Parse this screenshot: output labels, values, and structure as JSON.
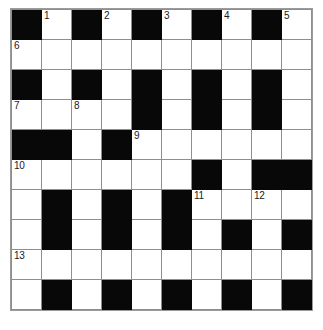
{
  "puzzle": {
    "title": "Crossword Grid",
    "size": {
      "rows": 10,
      "cols": 10
    },
    "colors": {
      "block": "#080808",
      "empty": "#ffffff",
      "gridline": "#8e8e8e",
      "number": "#1a1a1a"
    },
    "legend": {
      "block_char": "#",
      "empty_char": "."
    },
    "grid": [
      "#.#.#.#.#.",
      "..........",
      "#.#.#.#.#.",
      "....#.#.#.",
      "##.#......",
      "......#.##",
      ".#.#.#....",
      ".#.#.#.#.#",
      "..........",
      ".#.#.#.#.#"
    ],
    "numbers": [
      {
        "label": "1",
        "row": 0,
        "col": 1
      },
      {
        "label": "2",
        "row": 0,
        "col": 3
      },
      {
        "label": "3",
        "row": 0,
        "col": 5
      },
      {
        "label": "4",
        "row": 0,
        "col": 7
      },
      {
        "label": "5",
        "row": 0,
        "col": 9
      },
      {
        "label": "6",
        "row": 1,
        "col": 0
      },
      {
        "label": "7",
        "row": 3,
        "col": 0
      },
      {
        "label": "8",
        "row": 3,
        "col": 2
      },
      {
        "label": "9",
        "row": 4,
        "col": 4
      },
      {
        "label": "10",
        "row": 5,
        "col": 0
      },
      {
        "label": "11",
        "row": 6,
        "col": 6
      },
      {
        "label": "12",
        "row": 6,
        "col": 8
      },
      {
        "label": "13",
        "row": 8,
        "col": 0
      }
    ]
  }
}
